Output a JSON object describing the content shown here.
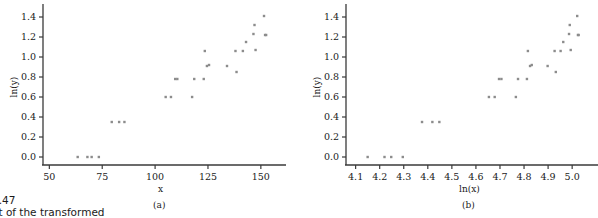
{
  "figure": {
    "caption_line1": "4.47",
    "caption_line2": "ot of the transformed"
  },
  "marker_color": "#8c8c8c",
  "axis_color": "#3a3a3a",
  "chart_data": [
    {
      "type": "scatter",
      "panel_label": "(a)",
      "title": "",
      "xlabel": "x",
      "ylabel": "ln(y)",
      "xlim": [
        47,
        160
      ],
      "ylim": [
        -0.08,
        1.47
      ],
      "xticks": [
        50,
        75,
        100,
        125,
        150
      ],
      "xticklabels": [
        "50",
        "75",
        "100",
        "125",
        "150"
      ],
      "yticks": [
        0.0,
        0.2,
        0.4,
        0.6,
        0.8,
        1.0,
        1.2,
        1.4
      ],
      "yticklabels": [
        "0.0",
        "0.2",
        "0.4",
        "0.6",
        "0.8",
        "1.0",
        "1.2",
        "1.4"
      ],
      "grid": false,
      "legend": "none",
      "x": [
        63.4,
        68.0,
        70.0,
        73.4,
        79.5,
        83.0,
        85.5,
        105.0,
        107.5,
        117.5,
        109.5,
        110.5,
        118.5,
        123.0,
        123.5,
        124.5,
        125.5,
        134.0,
        138.5,
        138.0,
        141.5,
        143.0,
        146.5,
        147.5,
        147.0,
        151.5,
        152.0,
        152.5
      ],
      "y": [
        0.0,
        0.0,
        0.0,
        0.0,
        0.35,
        0.35,
        0.35,
        0.6,
        0.6,
        0.6,
        0.78,
        0.78,
        0.78,
        0.78,
        1.06,
        0.91,
        0.92,
        0.91,
        0.85,
        1.06,
        1.06,
        1.15,
        1.23,
        1.07,
        1.32,
        1.41,
        1.22,
        1.22
      ]
    },
    {
      "type": "scatter",
      "panel_label": "(b)",
      "title": "",
      "xlabel": "ln(x)",
      "ylabel": "ln(y)",
      "xlim": [
        4.06,
        5.07
      ],
      "ylim": [
        -0.08,
        1.47
      ],
      "xticks": [
        4.1,
        4.2,
        4.3,
        4.4,
        4.5,
        4.6,
        4.7,
        4.8,
        4.9,
        5.0
      ],
      "xticklabels": [
        "4.1",
        "4.2",
        "4.3",
        "4.4",
        "4.5",
        "4.6",
        "4.7",
        "4.8",
        "4.9",
        "5.0"
      ],
      "yticks": [
        0.0,
        0.2,
        0.4,
        0.6,
        0.8,
        1.0,
        1.2,
        1.4
      ],
      "yticklabels": [
        "0.0",
        "0.2",
        "0.4",
        "0.6",
        "0.8",
        "1.0",
        "1.2",
        "1.4"
      ],
      "grid": false,
      "legend": "none",
      "x": [
        4.15,
        4.22,
        4.248,
        4.296,
        4.376,
        4.419,
        4.448,
        4.654,
        4.678,
        4.766,
        4.696,
        4.706,
        4.775,
        4.812,
        4.816,
        4.825,
        4.832,
        4.898,
        4.932,
        4.927,
        4.952,
        4.963,
        4.987,
        4.994,
        4.99,
        5.021,
        5.024,
        5.027
      ],
      "y": [
        0.0,
        0.0,
        0.0,
        0.0,
        0.35,
        0.35,
        0.35,
        0.6,
        0.6,
        0.6,
        0.78,
        0.78,
        0.78,
        0.78,
        1.06,
        0.91,
        0.92,
        0.91,
        0.85,
        1.06,
        1.06,
        1.15,
        1.23,
        1.07,
        1.32,
        1.41,
        1.22,
        1.22
      ]
    }
  ]
}
